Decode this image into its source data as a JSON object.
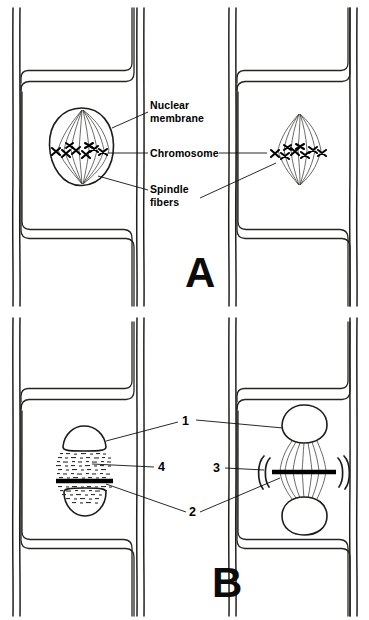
{
  "figure": {
    "background_color": "#ffffff",
    "ink_color": "#1c1c18"
  },
  "panels": [
    {
      "id": "A",
      "letter": "A",
      "description": "Two plant cells showing nuclei with spindle fibers and chromosomes at the metaphase plate",
      "labels": [
        {
          "id": "nuclear-membrane",
          "line1": "Nuclear",
          "line2": "membrane"
        },
        {
          "id": "chromosome",
          "line1": "Chromosome",
          "line2": ""
        },
        {
          "id": "spindle-fibers",
          "line1": "Spindle",
          "line2": "fibers"
        }
      ]
    },
    {
      "id": "B",
      "letter": "B",
      "description": "Two plant cells showing telophase and cytokinesis with daughter nuclei and cell plate",
      "labels": [
        {
          "id": "callout-1",
          "text": "1"
        },
        {
          "id": "callout-2",
          "text": "2"
        },
        {
          "id": "callout-3",
          "text": "3"
        },
        {
          "id": "callout-4",
          "text": "4"
        }
      ]
    }
  ]
}
